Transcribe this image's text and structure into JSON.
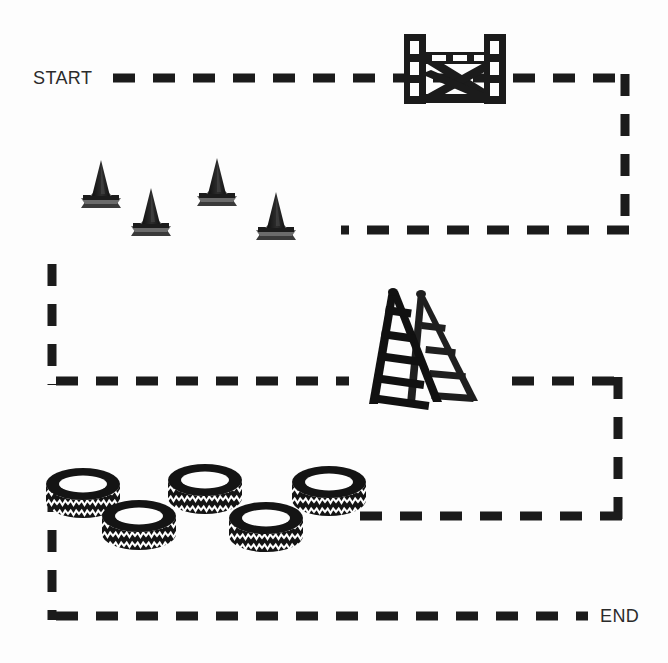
{
  "scene": {
    "title": "Obstacle Course Route Diagram",
    "width": 668,
    "height": 663,
    "background_color": "#fdfdfd",
    "ink_color": "#1b1b1b",
    "label_color": "#2b2b2b"
  },
  "labels": {
    "start": "START",
    "end": "END"
  },
  "path": {
    "style": "dashed",
    "dash_color": "#1b1b1b",
    "dash_width": 9,
    "dash_pattern": "22 18",
    "segments": [
      {
        "name": "top-run-right",
        "x1": 113,
        "y1": 78,
        "x2": 625,
        "y2": 78,
        "direction": "right"
      },
      {
        "name": "right-down-upper",
        "x1": 625,
        "y1": 78,
        "x2": 625,
        "y2": 230,
        "direction": "down"
      },
      {
        "name": "mid-run-left",
        "x1": 625,
        "y1": 230,
        "x2": 52,
        "y2": 230,
        "direction": "left"
      },
      {
        "name": "left-down-upper",
        "x1": 52,
        "y1": 230,
        "x2": 52,
        "y2": 381,
        "direction": "down"
      },
      {
        "name": "mid-run-right",
        "x1": 52,
        "y1": 381,
        "x2": 618,
        "y2": 381,
        "direction": "right"
      },
      {
        "name": "right-down-lower",
        "x1": 618,
        "y1": 381,
        "x2": 618,
        "y2": 516,
        "direction": "down"
      },
      {
        "name": "lower-run-left",
        "x1": 618,
        "y1": 516,
        "x2": 52,
        "y2": 516,
        "direction": "left"
      },
      {
        "name": "left-down-lower",
        "x1": 52,
        "y1": 516,
        "x2": 52,
        "y2": 616,
        "direction": "down"
      },
      {
        "name": "bottom-run-right",
        "x1": 52,
        "y1": 616,
        "x2": 588,
        "y2": 616,
        "direction": "right"
      }
    ]
  },
  "obstacles": [
    {
      "id": "barrier",
      "type": "hurdle-barrier",
      "label": "Cross-braced barrier",
      "count": 1,
      "x": 404,
      "y": 34,
      "width": 102,
      "height": 70
    },
    {
      "id": "cones",
      "type": "traffic-cone",
      "label": "Traffic cones",
      "count": 4,
      "items": [
        {
          "x": 78,
          "y": 158,
          "w": 46,
          "h": 48
        },
        {
          "x": 128,
          "y": 186,
          "w": 46,
          "h": 48
        },
        {
          "x": 194,
          "y": 156,
          "w": 46,
          "h": 48
        },
        {
          "x": 253,
          "y": 190,
          "w": 46,
          "h": 48
        }
      ]
    },
    {
      "id": "ladder",
      "type": "step-ladder",
      "label": "Step ladder",
      "count": 1,
      "x": 366,
      "y": 288,
      "width": 118,
      "height": 118
    },
    {
      "id": "tires",
      "type": "tire",
      "label": "Tires",
      "count": 5,
      "items": [
        {
          "x": 46,
          "y": 468,
          "w": 74,
          "h": 52
        },
        {
          "x": 102,
          "y": 500,
          "w": 74,
          "h": 52
        },
        {
          "x": 168,
          "y": 464,
          "w": 74,
          "h": 52
        },
        {
          "x": 229,
          "y": 502,
          "w": 74,
          "h": 52
        },
        {
          "x": 292,
          "y": 466,
          "w": 74,
          "h": 52
        }
      ]
    }
  ],
  "label_positions": {
    "start": {
      "x": 33,
      "y": 84
    },
    "end": {
      "x": 600,
      "y": 622
    }
  }
}
